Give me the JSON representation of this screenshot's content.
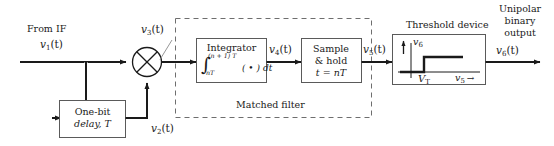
{
  "diagram": {
    "colors": {
      "line": "#1a1a1a",
      "dashed": "#6e6e6e",
      "box_border": "#5a5a5a",
      "background": "#ffffff"
    }
  },
  "input": {
    "source_label": "From IF",
    "signal_label_base": "v",
    "signal_label_sub": "1",
    "signal_label_arg": "(t)"
  },
  "mixer": {
    "name": "multiplier",
    "output_label_base": "v",
    "output_label_sub": "3",
    "output_label_arg": "(t)"
  },
  "delay_block": {
    "line1": "One-bit",
    "line2": "delay, T",
    "output_label_base": "v",
    "output_label_sub": "2",
    "output_label_arg": "(t)"
  },
  "matched_filter": {
    "caption": "Matched filter",
    "integrator": {
      "title": "Integrator",
      "integral_sign": "∫",
      "upper_limit": "(n + 1) T",
      "lower_limit": "nT",
      "integrand": "( • ) dt",
      "output_label_base": "v",
      "output_label_sub": "4",
      "output_label_arg": "(t)"
    },
    "sample_hold": {
      "line1": "Sample",
      "line2": "& hold",
      "line3": "t = nT",
      "output_label_base": "v",
      "output_label_sub": "5",
      "output_label_arg": "(t)"
    }
  },
  "threshold_device": {
    "caption": "Threshold device",
    "y_axis_label_base": "v",
    "y_axis_label_sub": "6",
    "x_axis_label_base": "v",
    "x_axis_label_sub": "5",
    "x_axis_arrow": "→",
    "threshold_label_base": "V",
    "threshold_label_sub": "T"
  },
  "output": {
    "line1": "Unipolar",
    "line2": "binary",
    "line3": "output",
    "signal_label_base": "v",
    "signal_label_sub": "6",
    "signal_label_arg": "(t)"
  }
}
